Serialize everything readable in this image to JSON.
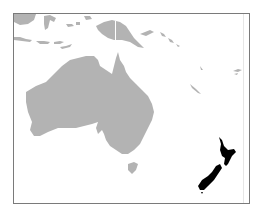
{
  "map": {
    "title": "Location of New Zealand in Oceania",
    "region": "Oceania",
    "highlighted_country": "New Zealand",
    "colors": {
      "background": "#ffffff",
      "land": "#b3b3b3",
      "highlight": "#000000",
      "frame": "#7a7a7a"
    },
    "features": [
      {
        "name": "Australia",
        "highlighted": false
      },
      {
        "name": "Tasmania",
        "highlighted": false
      },
      {
        "name": "New Guinea",
        "highlighted": false
      },
      {
        "name": "Indonesia",
        "highlighted": false
      },
      {
        "name": "Solomon Islands",
        "highlighted": false
      },
      {
        "name": "Vanuatu",
        "highlighted": false
      },
      {
        "name": "New Caledonia",
        "highlighted": false
      },
      {
        "name": "Fiji",
        "highlighted": false
      },
      {
        "name": "New Zealand",
        "highlighted": true
      }
    ]
  }
}
